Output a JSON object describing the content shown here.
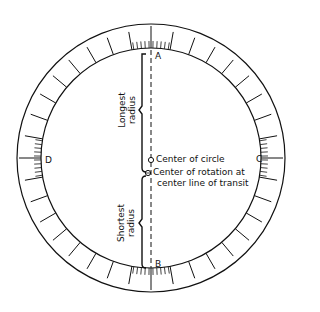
{
  "diagram": {
    "points": {
      "A": "A",
      "B": "B",
      "C": "C",
      "D": "D"
    },
    "labels": {
      "longest_radius_line1": "Longest",
      "longest_radius_line2": "radius",
      "shortest_radius_line1": "Shortest",
      "shortest_radius_line2": "radius",
      "center_of_circle": "Center of circle",
      "center_rotation_line1": "Center of rotation at",
      "center_rotation_line2": "center line of transit"
    },
    "geometry": {
      "center": [
        151,
        158
      ],
      "outer_radius": 134,
      "inner_radius": 110,
      "major_tick_count": 36,
      "minor_tick_spacing_deg": 2,
      "line_color": "#111111",
      "background": "#ffffff"
    }
  }
}
